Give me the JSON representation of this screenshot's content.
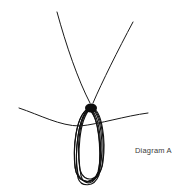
{
  "diagram": {
    "caption": "Diagram A",
    "colors": {
      "background": "#ffffff",
      "stroke": "#1a1a1a",
      "caption": "#3a3a3a"
    },
    "parts": [
      {
        "name": "left-strand",
        "from": [
          57,
          12
        ],
        "to": [
          90,
          103
        ]
      },
      {
        "name": "right-strand",
        "from": [
          133,
          22
        ],
        "to": [
          93,
          103
        ]
      },
      {
        "name": "crossing-strand",
        "from": [
          19,
          108
        ],
        "to": [
          148,
          113
        ]
      },
      {
        "name": "knot",
        "center": [
          91,
          108
        ]
      },
      {
        "name": "wrapped-loops",
        "center": [
          87,
          146
        ],
        "count": 6
      }
    ]
  }
}
